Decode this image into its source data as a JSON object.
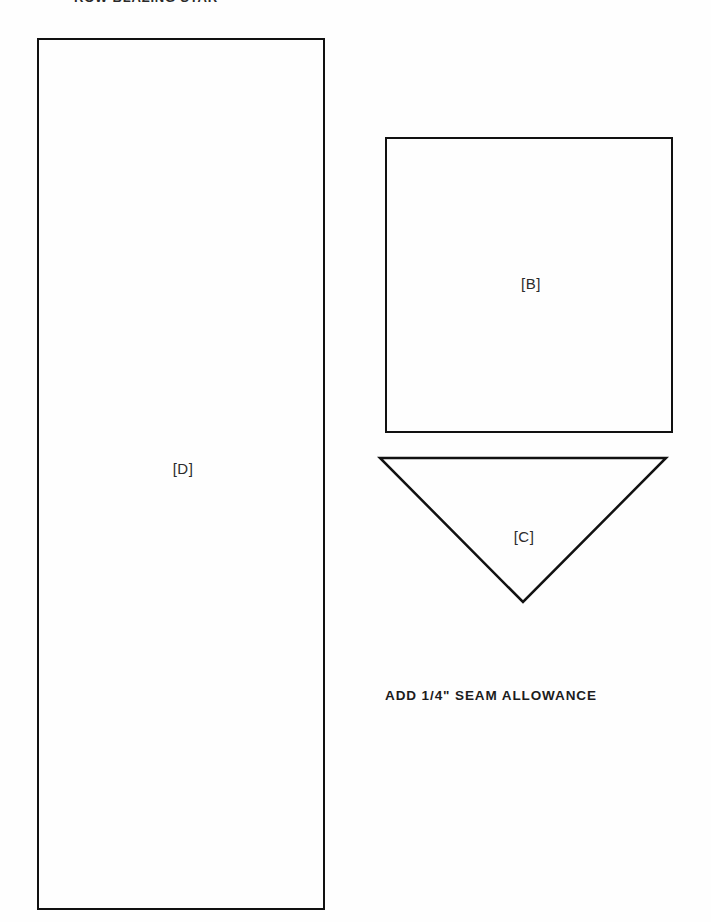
{
  "page": {
    "background_color": "#fefefe",
    "ink_color": "#111111",
    "width": 711,
    "height": 922
  },
  "header": {
    "title": "ROW BLAZING STAR"
  },
  "pieces": [
    {
      "id": "D",
      "label": "[D]",
      "shape": "rectangle",
      "x": 37,
      "y": 38,
      "width": 288,
      "height": 872
    },
    {
      "id": "B",
      "label": "[B]",
      "shape": "square",
      "x": 385,
      "y": 137,
      "width": 288,
      "height": 296
    },
    {
      "id": "C",
      "label": "[C]",
      "shape": "inverted-triangle",
      "x": 372,
      "y": 450,
      "width": 304,
      "height": 162,
      "points": "8,8 294,8 151,152"
    }
  ],
  "notes": {
    "seam_allowance": "ADD 1/4\" SEAM  ALLOWANCE"
  }
}
